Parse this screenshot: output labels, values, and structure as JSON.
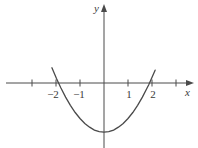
{
  "figure": {
    "background_color": "#ffffff",
    "stroke_color": "#4a4a4a",
    "text_color": "#3a3a3a"
  },
  "axes": {
    "x_axis_label": "x",
    "y_axis_label": "y",
    "origin_px": {
      "x": 104,
      "y": 83
    },
    "unit_px": 24,
    "x_ticks": [
      {
        "value": -3,
        "label": "",
        "px": 32
      },
      {
        "value": -2,
        "label": "−2",
        "px": 56
      },
      {
        "value": -1,
        "label": "−1",
        "px": 80
      },
      {
        "value": 1,
        "label": "1",
        "px": 128
      },
      {
        "value": 2,
        "label": "2",
        "px": 152
      },
      {
        "value": 3,
        "label": "",
        "px": 176
      }
    ],
    "y_ticks": []
  },
  "chart_data": {
    "type": "line",
    "title": "",
    "xlabel": "x",
    "ylabel": "y",
    "xlim": [
      -3.9,
      3.6
    ],
    "ylim": [
      -2.4,
      2.6
    ],
    "grid": false,
    "legend": "none",
    "series": [
      {
        "name": "parabola",
        "color": "#4a4a4a",
        "equation": "y = 0.57x^2 - 2.05",
        "vertex": [
          0,
          -2.05
        ],
        "roots": [
          -1.9,
          1.9
        ],
        "x": [
          -1.98,
          -1.8,
          -1.6,
          -1.4,
          -1.2,
          -1.0,
          -0.8,
          -0.6,
          -0.4,
          -0.2,
          0.0,
          0.2,
          0.4,
          0.6,
          0.8,
          1.0,
          1.2,
          1.4,
          1.6,
          1.8,
          1.86
        ],
        "y": [
          0.19,
          -0.2,
          -0.59,
          -0.93,
          -1.23,
          -1.48,
          -1.69,
          -1.84,
          -1.96,
          -2.03,
          -2.05,
          -2.03,
          -1.96,
          -1.84,
          -1.69,
          -1.48,
          -1.23,
          -0.93,
          -0.59,
          -0.2,
          -0.08
        ]
      }
    ],
    "annotations": []
  }
}
